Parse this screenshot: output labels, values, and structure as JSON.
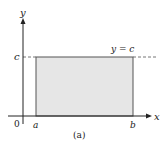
{
  "figure": {
    "caption": "(a)",
    "axes": {
      "x_label": "x",
      "y_label": "y",
      "origin_label": "0"
    },
    "points": {
      "a_label": "a",
      "b_label": "b",
      "c_label": "c"
    },
    "line_label": "y = c",
    "colors": {
      "fill": "#e6e6e6",
      "stroke": "#333333",
      "axis": "#222222",
      "dashed": "#666666"
    }
  }
}
